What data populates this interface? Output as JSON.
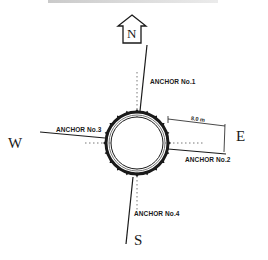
{
  "diagram": {
    "type": "anchor-layout-plan",
    "compass": {
      "north_indicator": "N",
      "north_arrow_icon": "north-arrow-icon",
      "directions": {
        "north": "N",
        "east": "E",
        "south": "S",
        "west": "W"
      }
    },
    "anchors": [
      {
        "label": "ANCHOR No.1",
        "direction": "north"
      },
      {
        "label": "ANCHOR No.2",
        "direction": "east"
      },
      {
        "label": "ANCHOR No.3",
        "direction": "west"
      },
      {
        "label": "ANCHOR No.4",
        "direction": "south"
      }
    ],
    "dimension": {
      "label": "8.0 m"
    },
    "colors": {
      "ink": "#1a1a1a",
      "background": "#ffffff"
    }
  }
}
